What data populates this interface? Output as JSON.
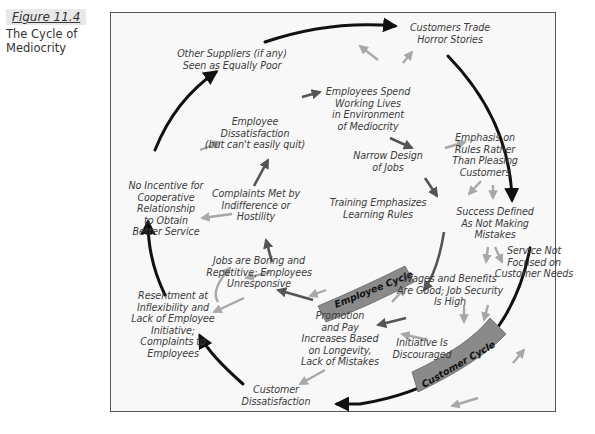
{
  "figure": {
    "number": "Figure 11.4",
    "title": "The Cycle of Mediocrity"
  },
  "cycles": {
    "employee_label": "Employee Cycle",
    "customer_label": "Customer Cycle"
  },
  "nodes": {
    "customers_trade": "Customers Trade Horror Stories",
    "other_suppliers": "Other Suppliers (if any) Seen as Equally Poor",
    "employees_spend": "Employees Spend Working Lives in Environment of Mediocrity",
    "employee_dissatisfaction": "Employee Dissatisfaction (but can't easily quit)",
    "narrow_design": "Narrow Design of Jobs",
    "emphasis_rules": "Emphasis on Rules Rather Than Pleasing Customers",
    "no_incentive": "No Incentive for Cooperative Relationship to Obtain Better Service",
    "complaints_met": "Complaints Met by Indifference or Hostility",
    "training": "Training Emphasizes Learning Rules",
    "success_defined": "Success Defined As Not Making Mistakes",
    "service_not_focused": "Service Not Focused on Customer Needs",
    "jobs_boring": "Jobs are Boring and Repetitive; Employees Unresponsive",
    "wages": "Wages and Benefits Are Good; Job Security Is High",
    "resentment": "Resentment at Inflexibility and Lack of Employee Initiative; Complaints to Employees",
    "promotion": "Promotion and Pay Increases Based on Longevity, Lack of Mistakes",
    "initiative": "Initiative Is Discouraged",
    "customer_dissatisfaction": "Customer Dissatisfaction"
  },
  "lines": {
    "customers_trade": [
      "Customers Trade",
      "Horror Stories"
    ],
    "other_suppliers": [
      "Other Suppliers (if any)",
      "Seen as Equally Poor"
    ],
    "employees_spend": [
      "Employees Spend",
      "Working Lives",
      "in Environment",
      "of Mediocrity"
    ],
    "employee_dissatisfaction": [
      "Employee",
      "Dissatisfaction",
      "(but can't easily quit)"
    ],
    "narrow_design": [
      "Narrow Design",
      "of Jobs"
    ],
    "emphasis_rules": [
      "Emphasis on",
      "Rules Rather",
      "Than Pleasing",
      "Customers"
    ],
    "no_incentive": [
      "No Incentive for",
      "Cooperative",
      "Relationship",
      "to Obtain",
      "Better Service"
    ],
    "complaints_met": [
      "Complaints Met by",
      "Indifference or",
      "Hostility"
    ],
    "training": [
      "Training Emphasizes",
      "Learning Rules"
    ],
    "success_defined": [
      "Success Defined",
      "As Not Making",
      "Mistakes"
    ],
    "service_not_focused": [
      "Service Not",
      "Focused on",
      "Customer Needs"
    ],
    "jobs_boring": [
      "Jobs are Boring and",
      "Repetitive; Employees",
      "Unresponsive"
    ],
    "wages": [
      "Wages and Benefits",
      "Are Good; Job Security",
      "Is High"
    ],
    "resentment": [
      "Resentment at",
      "Inflexibility and",
      "Lack of Employee",
      "Initiative;",
      "Complaints to",
      "Employees"
    ],
    "promotion": [
      "Promotion",
      "and Pay",
      "Increases Based",
      "on Longevity,",
      "Lack of Mistakes"
    ],
    "initiative": [
      "Initiative Is",
      "Discouraged"
    ],
    "customer_dissatisfaction": [
      "Customer",
      "Dissatisfaction"
    ]
  },
  "colors": {
    "frame_bg": "#f8f8f8",
    "outer_cycle": "#111111",
    "inner_arrow_dark": "#555555",
    "inner_arrow_light": "#a8a8a8",
    "cycle_band": "#8a8a8a",
    "text": "#3c3c3c"
  }
}
